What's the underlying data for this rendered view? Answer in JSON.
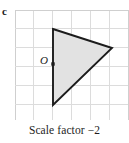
{
  "part": {
    "label": "c"
  },
  "caption": {
    "text": "Scale factor −2"
  },
  "figure": {
    "origin_label": "O",
    "grid": {
      "x_start": 15,
      "y_start": 10,
      "x_end": 128,
      "y_end": 120,
      "cell_size": 18.9,
      "columns": 6,
      "rows": 6,
      "line_color": "#dcdcdc",
      "border_color": "#cfcfcf"
    },
    "shape": {
      "name": "triangle",
      "fill_color": "#e2e2e2",
      "stroke_color": "#1c1c1c",
      "stroke_width": 1.9,
      "vertices": [
        {
          "x": 53,
          "y": 29
        },
        {
          "x": 112,
          "y": 48
        },
        {
          "x": 53,
          "y": 105
        }
      ]
    },
    "center_point": {
      "x": 53,
      "y": 64,
      "size": 3.4,
      "color": "#1c1c1c"
    }
  }
}
